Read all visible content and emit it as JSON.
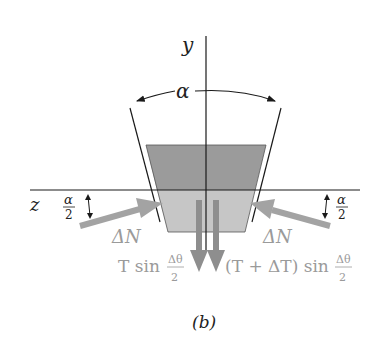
{
  "figure": {
    "caption": "(b)",
    "axes": {
      "y_label": "y",
      "z_label": "z"
    },
    "angle_label": "α",
    "half_angle": {
      "numerator": "α",
      "denominator": "2"
    },
    "normal_force_label": "ΔN",
    "tension_left": {
      "prefix": "T sin",
      "numerator": "Δθ",
      "denominator": "2"
    },
    "tension_right": {
      "prefix": "(T + ΔT) sin",
      "numerator": "Δθ",
      "denominator": "2"
    },
    "colors": {
      "belt_dark": "#9b9b9b",
      "belt_light": "#c4c4c4",
      "arrow": "#a3a3a3",
      "line": "#1a1a1a",
      "label_gray": "#9a9a9a"
    }
  }
}
